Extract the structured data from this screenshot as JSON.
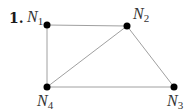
{
  "problem_number": "1.",
  "colors": {
    "edge": "#a0a0a0",
    "node": "#000000",
    "text": "#333333"
  },
  "nodes": [
    {
      "id": "N1",
      "letter": "N",
      "sub": "1",
      "x": 47,
      "y": 25
    },
    {
      "id": "N2",
      "letter": "N",
      "sub": "2",
      "x": 127,
      "y": 26
    },
    {
      "id": "N3",
      "letter": "N",
      "sub": "3",
      "x": 174,
      "y": 87
    },
    {
      "id": "N4",
      "letter": "N",
      "sub": "4",
      "x": 47,
      "y": 87
    }
  ],
  "edges": [
    [
      "N1",
      "N2"
    ],
    [
      "N1",
      "N4"
    ],
    [
      "N2",
      "N4"
    ],
    [
      "N2",
      "N3"
    ],
    [
      "N4",
      "N3"
    ]
  ]
}
